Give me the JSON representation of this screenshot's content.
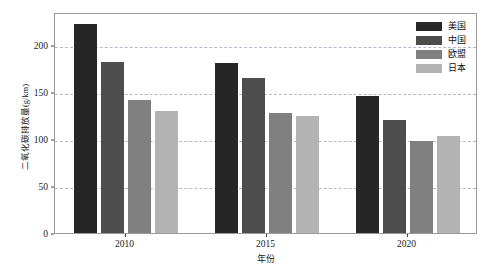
{
  "chart_data": {
    "type": "bar",
    "title": "",
    "subtitle": "",
    "xlabel": "年份",
    "ylabel": "二氧化碳排放量(g/km)",
    "categories": [
      "2010",
      "2015",
      "2020"
    ],
    "series": [
      {
        "name": "美国",
        "color": "#262626",
        "values": [
          222,
          181,
          146
        ]
      },
      {
        "name": "中国",
        "color": "#4d4d4d",
        "values": [
          182,
          165,
          120
        ]
      },
      {
        "name": "欧盟",
        "color": "#808080",
        "values": [
          141,
          128,
          98
        ]
      },
      {
        "name": "日本",
        "color": "#b3b3b3",
        "values": [
          130,
          124,
          103
        ]
      }
    ],
    "ylim": [
      0,
      235
    ],
    "yticks": [
      0,
      50,
      100,
      150,
      200
    ],
    "ytick_labels": [
      "0",
      "50",
      "100",
      "150",
      "200"
    ],
    "grid": true,
    "grid_axis": "y",
    "grid_style": "dashed",
    "grid_color": "#b9b9c6",
    "legend_position": "top-right",
    "plot_border_color": "#9a9a9a",
    "background_color": "#ffffff"
  }
}
